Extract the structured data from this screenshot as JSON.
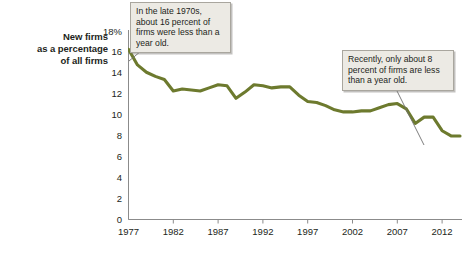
{
  "chart_data": {
    "type": "line",
    "title": "",
    "xlabel": "",
    "ylabel": "New firms as a percentage of all firms",
    "ylim": [
      0,
      18
    ],
    "xlim": [
      1977,
      2014
    ],
    "grid": false,
    "legend": "none",
    "line_color": "#6d7a2e",
    "y_ticks": [
      "0",
      "2",
      "4",
      "6",
      "8",
      "10",
      "12",
      "14",
      "16",
      "18%"
    ],
    "x_ticks": [
      "1977",
      "1982",
      "1987",
      "1992",
      "1997",
      "2002",
      "2007",
      "2012"
    ],
    "x": [
      1977,
      1978,
      1979,
      1980,
      1981,
      1982,
      1983,
      1984,
      1985,
      1986,
      1987,
      1988,
      1989,
      1990,
      1991,
      1992,
      1993,
      1994,
      1995,
      1996,
      1997,
      1998,
      1999,
      2000,
      2001,
      2002,
      2003,
      2004,
      2005,
      2006,
      2007,
      2008,
      2009,
      2010,
      2011,
      2012,
      2013,
      2014
    ],
    "values": [
      16.3,
      14.8,
      14.1,
      13.7,
      13.4,
      12.3,
      12.5,
      12.4,
      12.3,
      12.6,
      12.9,
      12.8,
      11.6,
      12.2,
      12.9,
      12.8,
      12.6,
      12.7,
      12.7,
      11.9,
      11.3,
      11.2,
      10.9,
      10.5,
      10.3,
      10.3,
      10.4,
      10.4,
      10.7,
      11.0,
      11.1,
      10.6,
      9.2,
      9.8,
      9.8,
      8.5,
      8.0,
      8.0
    ],
    "annotations": [
      {
        "name": "early-callout",
        "text": "In the late 1970s, about 16 percent of firms were less than a year old.",
        "points_to_year": 1977,
        "points_to_value": 16.3
      },
      {
        "name": "recent-callout",
        "text": "Recently, only about 8 percent of firms are less than a year old.",
        "points_to_year": 2013,
        "points_to_value": 8.0
      }
    ]
  },
  "axis_title": {
    "line1": "New firms",
    "line2": "as a percentage",
    "line3": "of all firms"
  },
  "y_ticks": [
    {
      "label": "18%",
      "value": 18
    },
    {
      "label": "16",
      "value": 16
    },
    {
      "label": "14",
      "value": 14
    },
    {
      "label": "12",
      "value": 12
    },
    {
      "label": "10",
      "value": 10
    },
    {
      "label": "8",
      "value": 8
    },
    {
      "label": "6",
      "value": 6
    },
    {
      "label": "4",
      "value": 4
    },
    {
      "label": "2",
      "value": 2
    },
    {
      "label": "0",
      "value": 0
    }
  ],
  "x_ticks": [
    {
      "label": "1977",
      "value": 1977
    },
    {
      "label": "1982",
      "value": 1982
    },
    {
      "label": "1987",
      "value": 1987
    },
    {
      "label": "1992",
      "value": 1992
    },
    {
      "label": "1997",
      "value": 1997
    },
    {
      "label": "2002",
      "value": 2002
    },
    {
      "label": "2007",
      "value": 2007
    },
    {
      "label": "2012",
      "value": 2012
    }
  ],
  "callouts": {
    "early": "In the late 1970s, about 16 percent of firms were less than a year old.",
    "recent": "Recently, only about 8 percent of firms are less than a year old."
  }
}
